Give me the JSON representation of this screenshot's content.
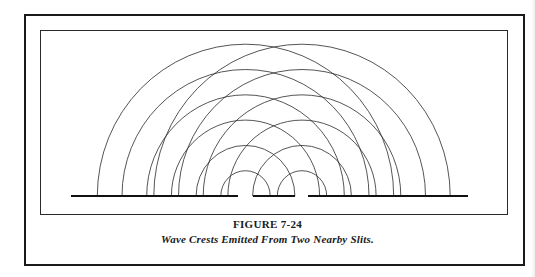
{
  "figure": {
    "number_label": "FIGURE 7-24",
    "caption": "Wave Crests Emitted From Two Nearby Slits."
  },
  "diagram": {
    "baseline_y": 196,
    "barrier_segments": [
      {
        "name": "left-barrier",
        "x1": 71,
        "x2": 238
      },
      {
        "name": "middle-barrier",
        "x1": 253,
        "x2": 295
      },
      {
        "name": "right-barrier",
        "x1": 308,
        "x2": 468
      }
    ],
    "slits": [
      {
        "name": "slit-1",
        "center_x": 245.5
      },
      {
        "name": "slit-2",
        "center_x": 302
      }
    ],
    "wave_crests_per_slit": 6,
    "crest_spacing_x": 24.7,
    "crest_spacing_y": 25.3,
    "line_color": "#2a2a2a",
    "barrier_color": "#111111"
  }
}
